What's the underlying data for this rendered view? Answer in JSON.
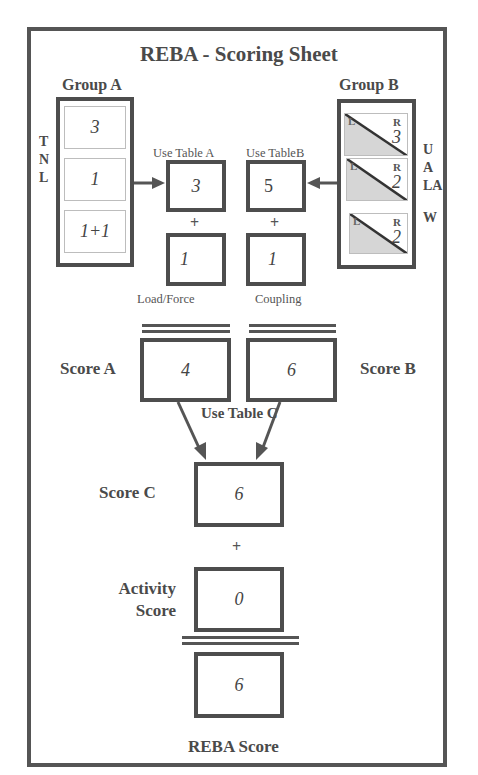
{
  "title": "REBA - Scoring Sheet",
  "group_a": {
    "label": "Group A",
    "side_letters": [
      "T",
      "N",
      "L"
    ],
    "values": [
      "3",
      "1",
      "1+1"
    ]
  },
  "group_b": {
    "label": "Group B",
    "side_letters": [
      "U",
      "A",
      "LA",
      "W"
    ],
    "rows": [
      {
        "left": "L",
        "right": "R",
        "value": "3"
      },
      {
        "left": "L",
        "right": "R",
        "value": "2"
      },
      {
        "left": "L",
        "right": "R",
        "value": "2"
      }
    ]
  },
  "table_a": {
    "label": "Use Table A",
    "value": "3"
  },
  "table_b": {
    "label": "Use TableB",
    "value": "5"
  },
  "load_force": {
    "label": "Load/Force",
    "value": "1"
  },
  "coupling": {
    "label": "Coupling",
    "value": "1"
  },
  "plus": "+",
  "score_a": {
    "label": "Score A",
    "value": "4"
  },
  "score_b": {
    "label": "Score B",
    "value": "6"
  },
  "table_c": {
    "label": "Use Table C"
  },
  "score_c": {
    "label": "Score C",
    "value": "6"
  },
  "activity": {
    "label_line1": "Activity",
    "label_line2": "Score",
    "value": "0"
  },
  "reba": {
    "label": "REBA Score",
    "value": "6"
  }
}
